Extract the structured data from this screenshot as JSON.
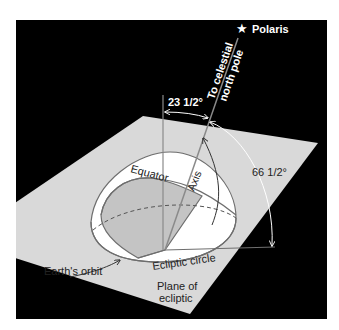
{
  "colors": {
    "background": "#000000",
    "plane": "#d9d9d9",
    "dome": "#ffffff",
    "shaded": "#c4c4c4",
    "line": "#6e6e6e",
    "dark_text": "#222222",
    "light_text": "#ffffff"
  },
  "labels": {
    "polaris": "Polaris",
    "celestial_line1": "To celestial",
    "celestial_line2": "north pole",
    "angle_small": "23 1/2°",
    "angle_large": "66 1/2°",
    "equator": "Equator",
    "axis": "Axis",
    "earths_orbit": "Earth's orbit",
    "ecliptic_circle": "Ecliptic circle",
    "plane_line1": "Plane of",
    "plane_line2": "ecliptic"
  },
  "icons": {
    "star": "star-icon"
  }
}
